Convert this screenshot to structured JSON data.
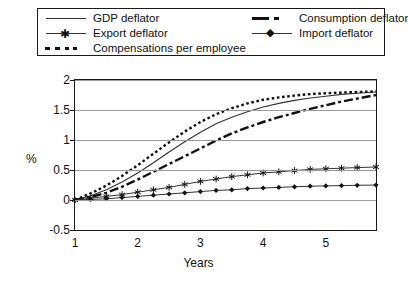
{
  "chart_data": {
    "type": "line",
    "title": "",
    "xlabel": "Years",
    "ylabel": "%",
    "xlim": [
      1,
      5.8
    ],
    "ylim": [
      -0.5,
      2
    ],
    "yticks": [
      -0.5,
      0,
      0.5,
      1,
      1.5,
      2
    ],
    "ytick_labels": [
      "-0.5",
      "0",
      "0.5",
      "1",
      "1.5",
      "2"
    ],
    "xticks": [
      1,
      2,
      3,
      4,
      5
    ],
    "xtick_labels": [
      "1",
      "2",
      "3",
      "4",
      "5"
    ],
    "grid": true,
    "legend_position": "top",
    "x": [
      1,
      1.25,
      1.5,
      1.75,
      2,
      2.25,
      2.5,
      2.75,
      3,
      3.25,
      3.5,
      3.75,
      4,
      4.25,
      4.5,
      4.75,
      5,
      5.25,
      5.5,
      5.8
    ],
    "series": [
      {
        "name": "GDP deflator",
        "style": "solid",
        "marker": "none",
        "color": "#333333",
        "values": [
          0,
          0.07,
          0.17,
          0.3,
          0.45,
          0.62,
          0.8,
          0.97,
          1.13,
          1.27,
          1.38,
          1.47,
          1.55,
          1.61,
          1.66,
          1.7,
          1.73,
          1.76,
          1.78,
          1.8
        ]
      },
      {
        "name": "Consumption deflator",
        "style": "dashdot",
        "marker": "none",
        "color": "#111111",
        "values": [
          0,
          0.05,
          0.12,
          0.22,
          0.34,
          0.47,
          0.6,
          0.73,
          0.86,
          0.99,
          1.11,
          1.21,
          1.3,
          1.38,
          1.45,
          1.52,
          1.58,
          1.64,
          1.69,
          1.75
        ]
      },
      {
        "name": "Export deflator",
        "style": "solid",
        "marker": "asterisk",
        "color": "#333333",
        "values": [
          0,
          0.03,
          0.06,
          0.09,
          0.13,
          0.17,
          0.21,
          0.26,
          0.31,
          0.35,
          0.39,
          0.42,
          0.45,
          0.47,
          0.49,
          0.51,
          0.52,
          0.53,
          0.54,
          0.55
        ]
      },
      {
        "name": "Import deflator",
        "style": "solid",
        "marker": "diamond",
        "color": "#333333",
        "values": [
          0,
          0.01,
          0.02,
          0.04,
          0.06,
          0.08,
          0.1,
          0.12,
          0.14,
          0.16,
          0.17,
          0.19,
          0.2,
          0.21,
          0.22,
          0.23,
          0.235,
          0.24,
          0.245,
          0.25
        ]
      },
      {
        "name": "Compensations per employee",
        "style": "dotted",
        "marker": "none",
        "color": "#111111",
        "values": [
          0,
          0.11,
          0.24,
          0.4,
          0.58,
          0.77,
          0.96,
          1.14,
          1.3,
          1.43,
          1.53,
          1.61,
          1.67,
          1.71,
          1.74,
          1.765,
          1.78,
          1.79,
          1.8,
          1.81
        ]
      }
    ]
  },
  "legend": {
    "entries": [
      {
        "label": "GDP deflator"
      },
      {
        "label": "Consumption deflator"
      },
      {
        "label": "Export deflator"
      },
      {
        "label": "Import deflator"
      },
      {
        "label": "Compensations per employee"
      }
    ]
  }
}
